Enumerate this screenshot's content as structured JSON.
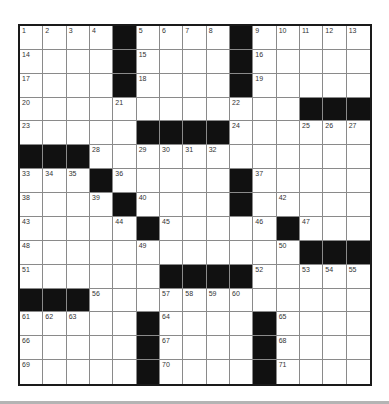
{
  "puzzle": {
    "rows": 15,
    "cols": 15,
    "colors": {
      "block": "#111111",
      "grid_line": "#8a8a8a",
      "border": "#1a1a1a",
      "number": "#333333"
    },
    "layout": [
      "....#....#.....",
      "....#....#.....",
      "....#....#.....",
      "............###",
      ".....####......",
      "###............",
      "...#.....#.....",
      "....#....#.....",
      ".....#.....#...",
      "............###",
      "......####.....",
      "###............",
      ".....#....#....",
      ".....#....#....",
      ".....#....#...."
    ],
    "numbers": [
      [
        1,
        2,
        3,
        4,
        0,
        5,
        6,
        7,
        8,
        0,
        9,
        10,
        11,
        12,
        13
      ],
      [
        14,
        0,
        0,
        0,
        0,
        15,
        0,
        0,
        0,
        0,
        16,
        0,
        0,
        0,
        0
      ],
      [
        17,
        0,
        0,
        0,
        0,
        18,
        0,
        0,
        0,
        0,
        19,
        0,
        0,
        0,
        0
      ],
      [
        20,
        0,
        0,
        0,
        21,
        0,
        0,
        0,
        0,
        22,
        0,
        0,
        0,
        0,
        0
      ],
      [
        23,
        0,
        0,
        0,
        0,
        0,
        0,
        0,
        0,
        24,
        0,
        0,
        25,
        26,
        27
      ],
      [
        0,
        0,
        0,
        28,
        0,
        29,
        30,
        31,
        32,
        0,
        0,
        0,
        0,
        0,
        0
      ],
      [
        33,
        34,
        35,
        0,
        36,
        0,
        0,
        0,
        0,
        0,
        37,
        0,
        0,
        0,
        0
      ],
      [
        38,
        0,
        0,
        39,
        0,
        40,
        0,
        0,
        0,
        41,
        0,
        42,
        0,
        0,
        0
      ],
      [
        43,
        0,
        0,
        0,
        44,
        0,
        45,
        0,
        0,
        0,
        46,
        0,
        47,
        0,
        0
      ],
      [
        48,
        0,
        0,
        0,
        0,
        49,
        0,
        0,
        0,
        0,
        0,
        50,
        0,
        0,
        0
      ],
      [
        51,
        0,
        0,
        0,
        0,
        0,
        0,
        0,
        0,
        0,
        52,
        0,
        53,
        54,
        55
      ],
      [
        0,
        0,
        0,
        56,
        0,
        0,
        57,
        58,
        59,
        60,
        0,
        0,
        0,
        0,
        0
      ],
      [
        61,
        62,
        63,
        0,
        0,
        0,
        64,
        0,
        0,
        0,
        0,
        65,
        0,
        0,
        0
      ],
      [
        66,
        0,
        0,
        0,
        0,
        0,
        67,
        0,
        0,
        0,
        0,
        68,
        0,
        0,
        0
      ],
      [
        69,
        0,
        0,
        0,
        0,
        0,
        70,
        0,
        0,
        0,
        0,
        71,
        0,
        0,
        0
      ]
    ]
  }
}
